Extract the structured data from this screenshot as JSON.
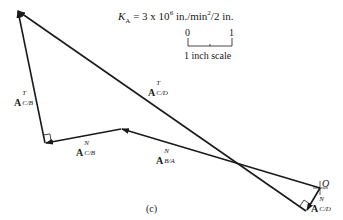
{
  "figure": {
    "equation": {
      "symbol": "K",
      "subscript": "A",
      "equals": "= 3 x 10",
      "exponent": "6",
      "units_main": "in./min",
      "units_exp": "2",
      "units_tail": "/2 in."
    },
    "scale": {
      "start": "0",
      "end": "1",
      "caption": "1 inch scale"
    },
    "caption": "(c)",
    "point_label": "O",
    "vectors": [
      {
        "id": "A_T_CB",
        "base": "A",
        "sup": "T",
        "sub": "C/B"
      },
      {
        "id": "A_N_CB",
        "base": "A",
        "sup": "N",
        "sub": "C/B"
      },
      {
        "id": "A_T_CD",
        "base": "A",
        "sup": "T",
        "sub": "C/D"
      },
      {
        "id": "A_N_BA",
        "base": "A",
        "sup": "N",
        "sub": "B/A"
      },
      {
        "id": "A_N_CD",
        "base": "A",
        "sup": "N",
        "sub": "C/D"
      }
    ]
  }
}
